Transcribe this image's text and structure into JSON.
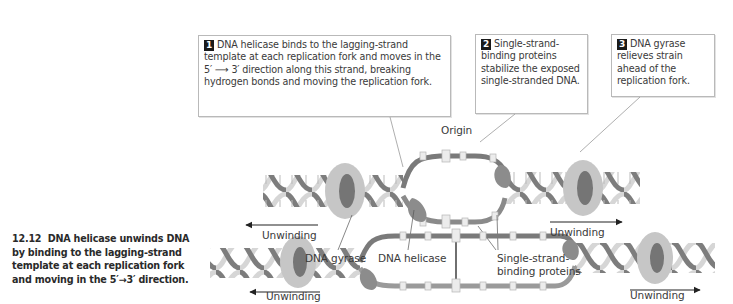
{
  "callouts": [
    {
      "number": "1",
      "text": "DNA helicase binds to the lagging-strand template at each replication fork and moves in the 5′ ⟶ 3′ direction along this strand, breaking hydrogen bonds and moving the replication fork."
    },
    {
      "number": "2",
      "text": "Single-strand-binding proteins stabilize the exposed single-stranded DNA."
    },
    {
      "number": "3",
      "text": "DNA gyrase relieves strain ahead of the replication fork."
    }
  ],
  "labels": {
    "origin": "Origin",
    "unwinding_top_left": "Unwinding",
    "unwinding_top_right": "Unwinding",
    "unwinding_bottom_left": "Unwinding",
    "unwinding_bottom_right": "Unwinding",
    "dna_gyrase": "DNA gyrase",
    "dna_helicase": "DNA helicase",
    "ssb_line1": "Single-strand-",
    "ssb_line2": "binding proteins"
  },
  "caption": {
    "figure_number": "12.12",
    "text": "DNA helicase unwinds DNA by binding to the lagging-strand template at each replication fork and moving in the 5′→3′ direction."
  },
  "colors": {
    "strand_dark": "#7a7a7a",
    "strand_light": "#d2d2d2",
    "gyrase_ring": "#bdbdbd",
    "helicase": "#8c8c8c",
    "ssb": "#e6e6e6",
    "badge": "#1a1a1a"
  }
}
